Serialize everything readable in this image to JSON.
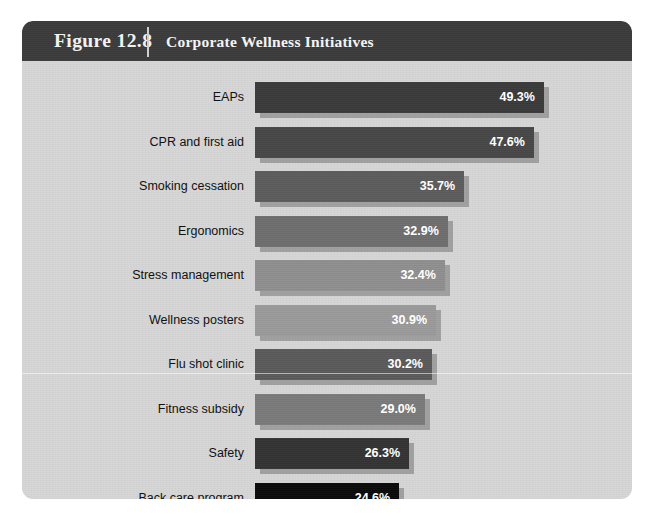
{
  "figure": {
    "number_label": "Figure 12.8",
    "title": "Corporate Wellness Initiatives",
    "header_bg": "#3b3b3b",
    "header_text_color": "#f2f2f2",
    "body_bg": "#d6d6d6"
  },
  "chart_data": {
    "type": "bar",
    "orientation": "horizontal",
    "title": "Corporate Wellness Initiatives",
    "xlabel": "",
    "ylabel": "",
    "xlim": [
      0,
      52
    ],
    "grid": false,
    "legend": false,
    "value_suffix": "%",
    "categories": [
      "EAPs",
      "CPR and first aid",
      "Smoking cessation",
      "Ergonomics",
      "Stress management",
      "Wellness posters",
      "Flu shot clinic",
      "Fitness subsidy",
      "Safety",
      "Back care program"
    ],
    "values": [
      49.3,
      47.6,
      35.7,
      32.9,
      32.4,
      30.9,
      30.2,
      29.0,
      26.3,
      24.6
    ],
    "value_labels": [
      "49.3%",
      "47.6%",
      "35.7%",
      "32.9%",
      "32.4%",
      "30.9%",
      "30.2%",
      "29.0%",
      "26.3%",
      "24.6%"
    ],
    "bar_colors": [
      "#3a3a3a",
      "#474747",
      "#5c5c5c",
      "#6e6e6e",
      "#8f8f8f",
      "#9a9a9a",
      "#5a5a5a",
      "#7a7a7a",
      "#333333",
      "#0a0a0a"
    ],
    "bars": [
      {
        "label": "EAPs",
        "value": 49.3,
        "value_label": "49.3%",
        "color": "#3a3a3a"
      },
      {
        "label": "CPR and first aid",
        "value": 47.6,
        "value_label": "47.6%",
        "color": "#474747"
      },
      {
        "label": "Smoking cessation",
        "value": 35.7,
        "value_label": "35.7%",
        "color": "#5c5c5c"
      },
      {
        "label": "Ergonomics",
        "value": 32.9,
        "value_label": "32.9%",
        "color": "#6e6e6e"
      },
      {
        "label": "Stress management",
        "value": 32.4,
        "value_label": "32.4%",
        "color": "#8f8f8f"
      },
      {
        "label": "Wellness posters",
        "value": 30.9,
        "value_label": "30.9%",
        "color": "#9a9a9a"
      },
      {
        "label": "Flu shot clinic",
        "value": 30.2,
        "value_label": "30.2%",
        "color": "#5a5a5a"
      },
      {
        "label": "Fitness subsidy",
        "value": 29.0,
        "value_label": "29.0%",
        "color": "#7a7a7a"
      },
      {
        "label": "Safety",
        "value": 26.3,
        "value_label": "26.3%",
        "color": "#333333"
      },
      {
        "label": "Back care program",
        "value": 24.6,
        "value_label": "24.6%",
        "color": "#0a0a0a"
      }
    ]
  }
}
